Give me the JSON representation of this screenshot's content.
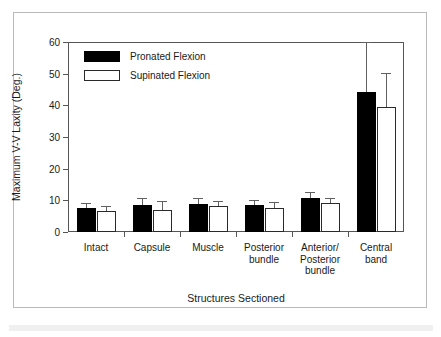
{
  "figure": {
    "frame_color": "#b9b9b9",
    "background": "#ffffff"
  },
  "chart_data": {
    "type": "bar",
    "title": "",
    "xlabel": "Structures Sectioned",
    "ylabel": "Maximum V-V Laxity (Deg.)",
    "ylim": [
      0,
      60
    ],
    "yticks": [
      0,
      10,
      20,
      30,
      40,
      50,
      60
    ],
    "ytick_labels": [
      "0",
      "10",
      "20",
      "30",
      "40",
      "50",
      "60"
    ],
    "grid": false,
    "legend_position": "upper left inside",
    "categories": [
      "Intact",
      "Capsule",
      "Muscle",
      "Posterior\nbundle",
      "Anterior/\nPosterior\nbundle",
      "Central\nband"
    ],
    "series": [
      {
        "name": "Pronated Flexion",
        "fill": "#000000",
        "values": [
          7.5,
          8.6,
          8.9,
          8.4,
          10.6,
          44.2
        ],
        "errors": [
          1.7,
          2.1,
          1.8,
          1.8,
          2.1,
          15.8
        ]
      },
      {
        "name": "Supinated Flexion",
        "fill": "#ffffff",
        "values": [
          6.7,
          6.9,
          8.2,
          7.7,
          9.3,
          39.6
        ],
        "errors": [
          1.4,
          2.9,
          1.7,
          1.7,
          1.5,
          10.5
        ]
      }
    ]
  }
}
